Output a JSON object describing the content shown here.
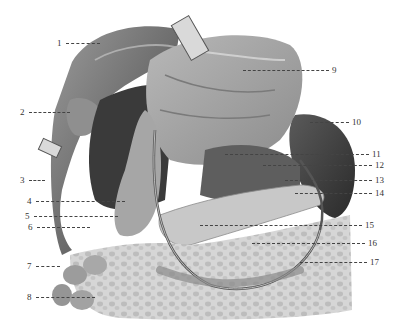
{
  "figure": {
    "type": "anatomical-illustration",
    "style": "grayscale"
  },
  "labels": [
    {
      "num": "1",
      "side": "left",
      "x": 57,
      "y": 43,
      "lineTo": 100
    },
    {
      "num": "2",
      "side": "left",
      "x": 20,
      "y": 112,
      "lineTo": 70
    },
    {
      "num": "3",
      "side": "left",
      "x": 20,
      "y": 180,
      "lineTo": 45
    },
    {
      "num": "4",
      "side": "left",
      "x": 27,
      "y": 201,
      "lineTo": 125
    },
    {
      "num": "5",
      "side": "left",
      "x": 25,
      "y": 216,
      "lineTo": 118
    },
    {
      "num": "6",
      "side": "left",
      "x": 28,
      "y": 227,
      "lineTo": 90
    },
    {
      "num": "7",
      "side": "left",
      "x": 27,
      "y": 266,
      "lineTo": 60
    },
    {
      "num": "8",
      "side": "left",
      "x": 27,
      "y": 297,
      "lineTo": 95
    },
    {
      "num": "9",
      "side": "right",
      "x": 332,
      "y": 70,
      "lineFrom": 243
    },
    {
      "num": "10",
      "side": "right",
      "x": 352,
      "y": 122,
      "lineFrom": 310
    },
    {
      "num": "11",
      "side": "right",
      "x": 372,
      "y": 154,
      "lineFrom": 225
    },
    {
      "num": "12",
      "side": "right",
      "x": 375,
      "y": 165,
      "lineFrom": 263
    },
    {
      "num": "13",
      "side": "right",
      "x": 375,
      "y": 180,
      "lineFrom": 285
    },
    {
      "num": "14",
      "side": "right",
      "x": 375,
      "y": 193,
      "lineFrom": 295
    },
    {
      "num": "15",
      "side": "right",
      "x": 365,
      "y": 225,
      "lineFrom": 200
    },
    {
      "num": "16",
      "side": "right",
      "x": 368,
      "y": 243,
      "lineFrom": 252
    },
    {
      "num": "17",
      "side": "right",
      "x": 370,
      "y": 262,
      "lineFrom": 300
    }
  ]
}
